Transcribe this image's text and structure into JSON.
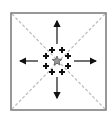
{
  "diagram": {
    "type": "radial-spread",
    "frame": {
      "x": 11,
      "y": 13,
      "w": 95,
      "h": 97,
      "stroke": "#777777"
    },
    "diagonals": {
      "style": "dashed",
      "color": "#bbbbbb"
    },
    "center": {
      "x": 57,
      "y": 61,
      "shape": "star",
      "fill": "#999999",
      "stroke": "#555555"
    },
    "arrows": [
      {
        "name": "up",
        "x1": 57,
        "y1": 44,
        "x2": 57,
        "y2": 21
      },
      {
        "name": "down",
        "x1": 57,
        "y1": 77,
        "x2": 57,
        "y2": 98
      },
      {
        "name": "left",
        "x1": 38,
        "y1": 61,
        "x2": 20,
        "y2": 61
      },
      {
        "name": "right",
        "x1": 74,
        "y1": 61,
        "x2": 96,
        "y2": 61
      }
    ],
    "markers": [
      {
        "x": 52,
        "y": 50
      },
      {
        "x": 62,
        "y": 50
      },
      {
        "x": 46,
        "y": 56
      },
      {
        "x": 68,
        "y": 56
      },
      {
        "x": 46,
        "y": 66
      },
      {
        "x": 68,
        "y": 66
      },
      {
        "x": 52,
        "y": 72
      },
      {
        "x": 62,
        "y": 72
      }
    ],
    "arrow_color": "#111111"
  }
}
